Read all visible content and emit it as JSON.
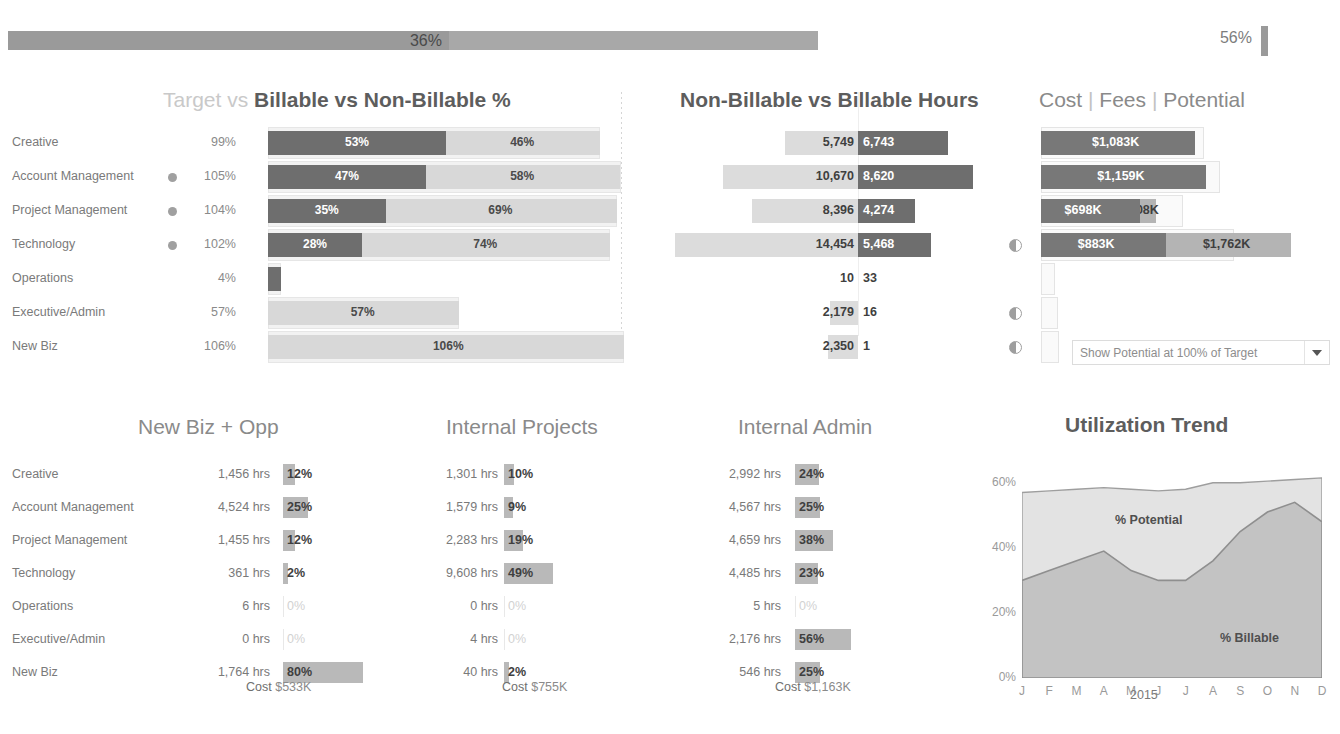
{
  "header": {
    "ghost_title": "",
    "overall": {
      "value_label": "36%",
      "fill_pct": 36,
      "secondary_label": "56%"
    }
  },
  "rows": [
    "Creative",
    "Account Management",
    "Project Management",
    "Technology",
    "Operations",
    "Executive/Admin",
    "New Biz"
  ],
  "chart1": {
    "title_prefix": "Target vs ",
    "title_main": "Billable vs Non-Billable %",
    "axis_label": "100%"
  },
  "chart2": {
    "title": "Non-Billable vs Billable Hours"
  },
  "chart3": {
    "title_a": "Cost",
    "title_b": "Fees",
    "title_c": "Potential",
    "title_sep": "|",
    "dropdown": "Show Potential at 100% of Target"
  },
  "panelA": {
    "title": "New Biz + Opp",
    "cost_key": "Cost",
    "cost_value": "$533K"
  },
  "panelB": {
    "title": "Internal Projects",
    "cost_key": "Cost",
    "cost_value": "$755K"
  },
  "panelC": {
    "title": "Internal Admin",
    "cost_key": "Cost",
    "cost_value": "$1,163K"
  },
  "trend": {
    "title": "Utilization Trend",
    "dropdown": "Billable vs  Potential",
    "label_potential": "% Potential",
    "label_billable": "% Billable",
    "year": "2015"
  },
  "colors": {
    "billable_dark": "#6e6e6e",
    "nonbillable_light": "#d8d8d8",
    "target_outline": "#e6e6e6",
    "fees_mid": "#b4b4b4",
    "cost_dark": "#787878",
    "area_billable": "#c3c3c3",
    "area_potential": "#e3e3e3",
    "kpi_bar": "#9a9a9a"
  },
  "chart_data": [
    {
      "type": "bar",
      "title": "Target vs Billable vs Non-Billable %",
      "categories": [
        "Creative",
        "Account Management",
        "Project Management",
        "Technology",
        "Operations",
        "Executive/Admin",
        "New Biz"
      ],
      "target_labels": [
        "99%",
        "105%",
        "104%",
        "102%",
        "4%",
        "57%",
        "106%"
      ],
      "has_marker": [
        false,
        true,
        true,
        true,
        false,
        false,
        false
      ],
      "series": [
        {
          "name": "Billable %",
          "values": [
            53,
            47,
            35,
            28,
            4,
            0,
            0
          ],
          "labels": [
            "53%",
            "47%",
            "35%",
            "28%",
            "",
            "",
            ""
          ]
        },
        {
          "name": "Non-Billable %",
          "values": [
            46,
            58,
            69,
            74,
            0,
            57,
            106
          ],
          "labels": [
            "46%",
            "58%",
            "69%",
            "74%",
            "",
            "57%",
            "106%"
          ]
        },
        {
          "name": "Target %",
          "values": [
            99,
            105,
            104,
            102,
            4,
            57,
            106
          ]
        }
      ],
      "axis_gridline": "100%",
      "xlim": [
        0,
        112
      ],
      "grid": false
    },
    {
      "type": "bar",
      "title": "Non-Billable vs Billable Hours",
      "categories": [
        "Creative",
        "Account Management",
        "Project Management",
        "Technology",
        "Operations",
        "Executive/Admin",
        "New Biz"
      ],
      "orientation": "diverging",
      "series": [
        {
          "name": "Non-Billable Hours",
          "values": [
            5749,
            10670,
            8396,
            14454,
            10,
            2179,
            2350
          ],
          "labels": [
            "5,749",
            "10,670",
            "8,396",
            "14,454",
            "10",
            "2,179",
            "2,350"
          ]
        },
        {
          "name": "Billable Hours",
          "values": [
            6743,
            8620,
            4274,
            5468,
            33,
            16,
            1
          ],
          "labels": [
            "6,743",
            "8,620",
            "4,274",
            "5,468",
            "33",
            "16",
            "1"
          ]
        }
      ],
      "xlim": [
        -15000,
        9000
      ]
    },
    {
      "type": "bar",
      "title": "Cost | Fees | Potential",
      "categories": [
        "Creative",
        "Account Management",
        "Project Management",
        "Technology",
        "Operations",
        "Executive/Admin",
        "New Biz"
      ],
      "has_marker": [
        false,
        false,
        false,
        true,
        false,
        true,
        true
      ],
      "series": [
        {
          "name": "Cost",
          "values": [
            1083,
            1159,
            698,
            883,
            0,
            0,
            0
          ],
          "labels": [
            "$1,083K",
            "$1,159K",
            "$698K",
            "$883K",
            "",
            "",
            ""
          ]
        },
        {
          "name": "Fees",
          "values": [
            1083,
            795,
            808,
            1762,
            0,
            0,
            0
          ],
          "labels": [
            "",
            "$795K",
            "$808K",
            "$1,762K",
            "",
            "",
            ""
          ]
        },
        {
          "name": "Potential",
          "values": [
            1150,
            1260,
            1000,
            1360,
            20,
            120,
            130
          ]
        }
      ],
      "units": "$K"
    },
    {
      "type": "bar",
      "title": "New Biz + Opp",
      "categories": [
        "Creative",
        "Account Management",
        "Project Management",
        "Technology",
        "Operations",
        "Executive/Admin",
        "New Biz"
      ],
      "hours": [
        "1,456 hrs",
        "4,524 hrs",
        "1,455 hrs",
        "361 hrs",
        "6 hrs",
        "0 hrs",
        "1,764 hrs"
      ],
      "values": [
        12,
        25,
        12,
        2,
        0,
        0,
        80
      ],
      "labels": [
        "12%",
        "25%",
        "12%",
        "2%",
        "0%",
        "0%",
        "80%"
      ],
      "footer": "Cost  $533K"
    },
    {
      "type": "bar",
      "title": "Internal Projects",
      "categories": [
        "Creative",
        "Account Management",
        "Project Management",
        "Technology",
        "Operations",
        "Executive/Admin",
        "New Biz"
      ],
      "hours": [
        "1,301 hrs",
        "1,579 hrs",
        "2,283 hrs",
        "9,608 hrs",
        "0 hrs",
        "4 hrs",
        "40 hrs"
      ],
      "values": [
        10,
        9,
        19,
        49,
        0,
        0,
        2
      ],
      "labels": [
        "10%",
        "9%",
        "19%",
        "49%",
        "0%",
        "0%",
        "2%"
      ],
      "footer": "Cost  $755K"
    },
    {
      "type": "bar",
      "title": "Internal Admin",
      "categories": [
        "Creative",
        "Account Management",
        "Project Management",
        "Technology",
        "Operations",
        "Executive/Admin",
        "New Biz"
      ],
      "hours": [
        "2,992 hrs",
        "4,567 hrs",
        "4,659 hrs",
        "4,485 hrs",
        "5 hrs",
        "2,176 hrs",
        "546 hrs"
      ],
      "values": [
        24,
        25,
        38,
        23,
        0,
        56,
        25
      ],
      "labels": [
        "24%",
        "25%",
        "38%",
        "23%",
        "0%",
        "56%",
        "25%"
      ],
      "footer": "Cost  $1,163K"
    },
    {
      "type": "area",
      "title": "Utilization Trend",
      "x": [
        "J",
        "F",
        "M",
        "A",
        "M",
        "J",
        "J",
        "A",
        "S",
        "O",
        "N",
        "D"
      ],
      "xlabel": "2015",
      "ylabel": "",
      "ylim": [
        0,
        60
      ],
      "yticks": [
        "0%",
        "20%",
        "40%",
        "60%"
      ],
      "series": [
        {
          "name": "% Billable",
          "values": [
            30,
            33,
            36,
            39,
            33,
            30,
            30,
            36,
            45,
            51,
            54,
            48
          ]
        },
        {
          "name": "% Potential",
          "values": [
            57,
            57.5,
            58,
            58.5,
            58,
            57.5,
            58,
            60,
            60,
            60.5,
            61,
            61.5
          ]
        }
      ],
      "legend": "inline-annotation"
    }
  ]
}
